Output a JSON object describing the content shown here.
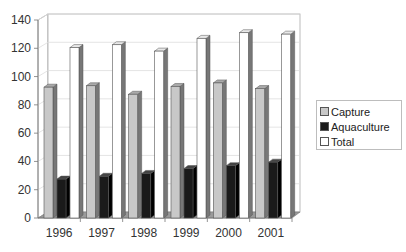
{
  "chart_data": {
    "type": "bar",
    "style": "3d-clustered-column",
    "title": "",
    "xlabel": "",
    "ylabel": "",
    "categories": [
      "1996",
      "1997",
      "1998",
      "1999",
      "2000",
      "2001"
    ],
    "series": [
      {
        "name": "Capture",
        "color": "#c8c8c8",
        "values": [
          92.5,
          93.5,
          87.5,
          93,
          95.5,
          91.5
        ]
      },
      {
        "name": "Aquaculture",
        "color": "#1a1a1a",
        "values": [
          27.5,
          29.5,
          31.5,
          35,
          37,
          39.5
        ]
      },
      {
        "name": "Total",
        "color": "#ffffff",
        "values": [
          120.5,
          122.5,
          118,
          127,
          131,
          130
        ]
      }
    ],
    "ylim": [
      0,
      140
    ],
    "yticks": [
      0,
      20,
      40,
      60,
      80,
      100,
      120,
      140
    ],
    "grid": true,
    "legend_position": "right"
  },
  "legend": {
    "items": [
      {
        "label": "Capture",
        "color": "#c8c8c8"
      },
      {
        "label": "Aquaculture",
        "color": "#1a1a1a"
      },
      {
        "label": "Total",
        "color": "#ffffff"
      }
    ]
  }
}
